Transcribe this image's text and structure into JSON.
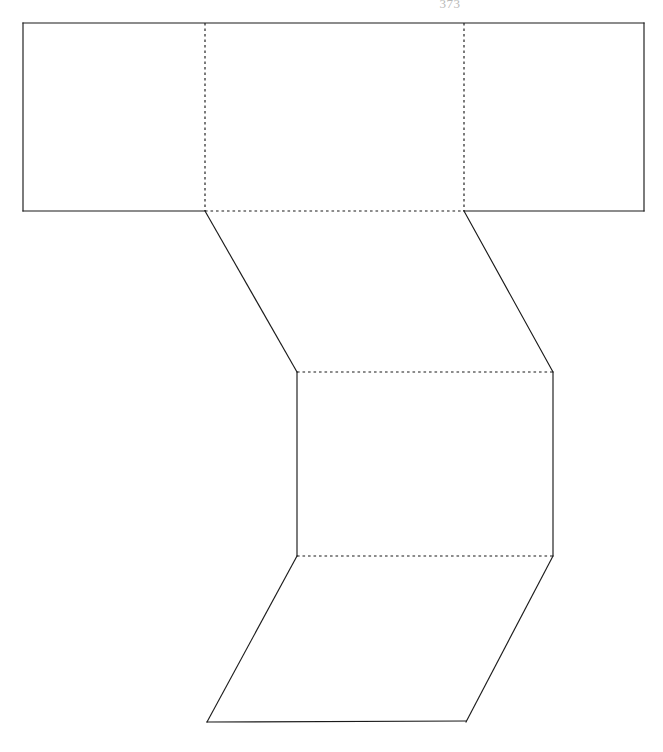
{
  "document": {
    "page_number": "373",
    "background_color": "#ffffff",
    "ink_color": "#1b1b1b",
    "page_number_color": "#b9b9b9",
    "title": "Geometric net diagram"
  },
  "figure": {
    "name": "prism-net",
    "line_styles": {
      "solid": "outer cut edge",
      "dashed": "interior fold edge"
    },
    "faces": [
      {
        "name": "top-band-left-face",
        "shape": "rectangle",
        "points": "23,23 205,23 205,211 23,211"
      },
      {
        "name": "top-band-middle-face",
        "shape": "rectangle",
        "points": "205,23 464,23 464,211 205,211"
      },
      {
        "name": "top-band-right-face",
        "shape": "rectangle",
        "points": "464,23 644,23 644,211 464,211"
      },
      {
        "name": "left-slant-face",
        "shape": "quadrilateral",
        "points": "205,211 464,211 553,372 297,372"
      },
      {
        "name": "center-rectangle-face",
        "shape": "rectangle",
        "points": "297,372 553,372 553,556 297,556"
      },
      {
        "name": "bottom-parallelogram-face",
        "shape": "parallelogram",
        "points": "297,556 553,556 466,722 207,722"
      }
    ],
    "solid_edges": [
      {
        "name": "top-band-top-edge",
        "d": "M 23 23 L 644 23"
      },
      {
        "name": "top-band-left-edge",
        "d": "M 23 23 L 23 211"
      },
      {
        "name": "top-band-right-edge",
        "d": "M 644 23 L 644 211"
      },
      {
        "name": "top-band-bottom-left-edge",
        "d": "M 23 211 L 205 211"
      },
      {
        "name": "top-band-bottom-right-edge",
        "d": "M 464 211 L 644 211"
      },
      {
        "name": "left-diagonal-edge",
        "d": "M 205 211 L 297 372"
      },
      {
        "name": "right-diagonal-edge",
        "d": "M 464 211 L 553 372"
      },
      {
        "name": "center-left-edge",
        "d": "M 297 372 L 297 556"
      },
      {
        "name": "center-right-edge",
        "d": "M 553 372 L 553 556"
      },
      {
        "name": "bottom-left-diagonal-edge",
        "d": "M 297 556 L 207 722"
      },
      {
        "name": "bottom-right-diagonal-edge",
        "d": "M 553 556 L 466 722"
      },
      {
        "name": "bottom-base-edge",
        "d": "M 207 722 L 466 721"
      }
    ],
    "fold_edges": [
      {
        "name": "fold-vertical-left",
        "d": "M 205 23 L 205 211"
      },
      {
        "name": "fold-vertical-right",
        "d": "M 464 23 L 464 211"
      },
      {
        "name": "fold-horizontal-top-band",
        "d": "M 205 211 L 464 211"
      },
      {
        "name": "fold-horizontal-center-top",
        "d": "M 297 372 L 553 372"
      },
      {
        "name": "fold-horizontal-center-bottom",
        "d": "M 297 556 L 553 556"
      }
    ],
    "vertices": [
      {
        "name": "vertex-top-left",
        "x": 23,
        "y": 23
      },
      {
        "name": "vertex-top-right",
        "x": 644,
        "y": 23
      },
      {
        "name": "vertex-band-bottom-left",
        "x": 23,
        "y": 211
      },
      {
        "name": "vertex-band-bottom-right",
        "x": 644,
        "y": 211
      },
      {
        "name": "vertex-fold-left",
        "x": 205,
        "y": 211
      },
      {
        "name": "vertex-fold-right",
        "x": 464,
        "y": 211
      },
      {
        "name": "vertex-center-top-left",
        "x": 297,
        "y": 372
      },
      {
        "name": "vertex-center-top-right",
        "x": 553,
        "y": 372
      },
      {
        "name": "vertex-center-bottom-left",
        "x": 297,
        "y": 556
      },
      {
        "name": "vertex-center-bottom-right",
        "x": 553,
        "y": 556
      },
      {
        "name": "vertex-base-left",
        "x": 207,
        "y": 722
      },
      {
        "name": "vertex-base-right",
        "x": 466,
        "y": 721
      }
    ]
  }
}
